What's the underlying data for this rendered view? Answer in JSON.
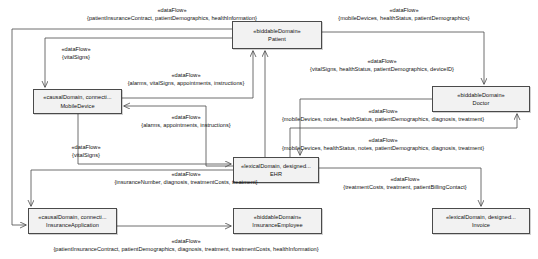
{
  "diagram": {
    "type": "problem-frame-context-diagram",
    "nodes": [
      {
        "id": "patient",
        "stereotype": "«biddableDomain»",
        "name": "Patient",
        "x": 232,
        "y": 21,
        "w": 90,
        "h": 28
      },
      {
        "id": "mobiledevice",
        "stereotype": "«causalDomain, connecti...",
        "name": "MobileDevice",
        "x": 33,
        "y": 89,
        "w": 89,
        "h": 25
      },
      {
        "id": "doctor",
        "stereotype": "«biddableDomain»",
        "name": "Doctor",
        "x": 432,
        "y": 86,
        "w": 98,
        "h": 26
      },
      {
        "id": "ehr",
        "stereotype": "«lexicalDomain, designed...",
        "name": "EHR",
        "x": 233,
        "y": 157,
        "w": 86,
        "h": 26
      },
      {
        "id": "insuranceapplication",
        "stereotype": "«causalDomain, connecti...",
        "name": "InsuranceApplication",
        "x": 28,
        "y": 208,
        "w": 89,
        "h": 26
      },
      {
        "id": "insuranceemployee",
        "stereotype": "«biddableDomain»",
        "name": "InsuranceEmployee",
        "x": 233,
        "y": 208,
        "w": 89,
        "h": 26
      },
      {
        "id": "invoice",
        "stereotype": "«lexicalDomain, designed...",
        "name": "Invoice",
        "x": 432,
        "y": 208,
        "w": 98,
        "h": 26
      }
    ],
    "edges": [
      {
        "id": "e1",
        "from": "patient",
        "to": "insuranceapplication",
        "stereotype": "«dataFlow»",
        "phenomena": "{patientInsuranceContract, patientDemographics, healthInformation}",
        "label_x": 172,
        "label_y": 6
      },
      {
        "id": "e2",
        "from": "patient",
        "to": "mobiledevice",
        "stereotype": "«dataFlow»",
        "phenomena": "{vitalSigns}",
        "label_x": 76,
        "label_y": 45
      },
      {
        "id": "e3",
        "from": "patient",
        "to": "doctor",
        "stereotype": "«dataFlow»",
        "phenomena": "{mobileDevices, healthStatus, patientDemographics}",
        "label_x": 404,
        "label_y": 6
      },
      {
        "id": "e4",
        "from": "mobiledevice",
        "to": "patient",
        "stereotype": "«dataFlow»",
        "phenomena": "{alarms, vitalSigns, appointments, instructions}",
        "label_x": 186,
        "label_y": 71
      },
      {
        "id": "e5",
        "from": "ehr",
        "to": "patient",
        "stereotype": "«dataFlow»",
        "phenomena": "{vitalSigns, healthStatus, patientDemographics, deviceID}",
        "label_x": 382,
        "label_y": 57
      },
      {
        "id": "e6",
        "from": "ehr",
        "to": "mobiledevice",
        "stereotype": "«dataFlow»",
        "phenomena": "{alarms, appointments, instructions}",
        "label_x": 186,
        "label_y": 113
      },
      {
        "id": "e7",
        "from": "doctor",
        "to": "ehr",
        "stereotype": "«dataFlow»",
        "phenomena": "{mobileDevices, notes, healthStatus, patientDemographics, diagnosis, treatment}",
        "label_x": 383,
        "label_y": 107
      },
      {
        "id": "e8",
        "from": "ehr",
        "to": "doctor",
        "stereotype": "«dataFlow»",
        "phenomena": "{mobileDevices, healthStatus, notes, patientDemographics, diagnosis, treatment}",
        "label_x": 383,
        "label_y": 136
      },
      {
        "id": "e9",
        "from": "mobiledevice",
        "to": "ehr",
        "stereotype": "«dataFlow»",
        "phenomena": "{vitalSigns}",
        "label_x": 86,
        "label_y": 143
      },
      {
        "id": "e10",
        "from": "insuranceapplication",
        "to": "ehr",
        "stereotype": "«dataFlow»",
        "phenomena": "{insuranceNumber, diagnosis, treatmentCosts, treatment}",
        "label_x": 186,
        "label_y": 170
      },
      {
        "id": "e11",
        "from": "ehr",
        "to": "invoice",
        "stereotype": "«dataFlow»",
        "phenomena": "{treatmentCosts, treatment, patientBillingContact}",
        "label_x": 405,
        "label_y": 175
      },
      {
        "id": "e12",
        "from": "insuranceapplication",
        "to": "insuranceemployee",
        "stereotype": "«dataFlow»",
        "phenomena": "{patientInsuranceContract, patientDemographics, diagnosis, treatment, treatmentCosts, healthInformation}",
        "label_x": 186,
        "label_y": 237
      }
    ]
  },
  "colors": {
    "node_fill": "#f2f2f2",
    "node_border": "#4a4a4a",
    "line": "#4a4a4a",
    "text": "#111111",
    "background": "#ffffff"
  }
}
